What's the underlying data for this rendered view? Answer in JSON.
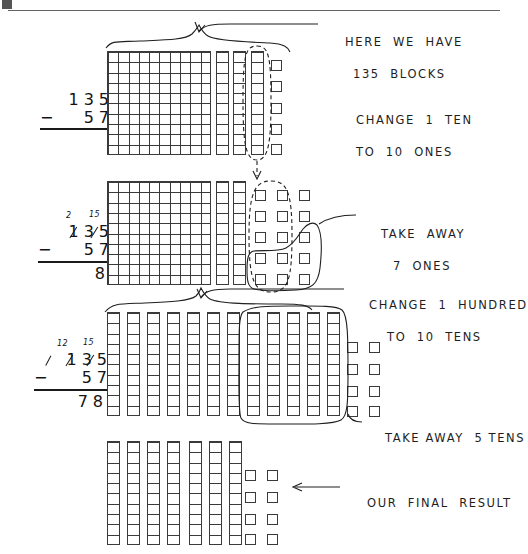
{
  "worksheet": {
    "title": "Subtraction with regrouping using base-ten blocks",
    "problem": {
      "minuend": "135",
      "subtrahend": "57",
      "difference": "78"
    },
    "ink_color": "#1f1f1f",
    "paper_color": "#ffffff"
  },
  "steps": [
    {
      "id": "step-1",
      "sum": {
        "minuend": "135",
        "minus_sign": "−",
        "subtrahend": "57",
        "answer": "",
        "regroup_marks": []
      },
      "annotations": [
        {
          "name": "here-we-have-135-blocks",
          "line1": "HERE  WE  HAVE",
          "line2": "135  BLOCKS"
        },
        {
          "name": "change-1-ten-to-10-ones",
          "line1": "CHANGE  1  TEN",
          "line2": "TO  10  ONES"
        }
      ],
      "blocks": {
        "hundreds": 1,
        "tens": 3,
        "ones": 5,
        "circled_tens": 1,
        "circled_ones": 0
      }
    },
    {
      "id": "step-2",
      "sum": {
        "minuend": "135",
        "minus_sign": "−",
        "subtrahend": "57",
        "answer": "8",
        "regroup_marks": [
          "2",
          "15"
        ]
      },
      "annotations": [
        {
          "name": "take-away-7-ones",
          "line1": "TAKE  AWAY",
          "line2": "7  ONES"
        },
        {
          "name": "change-1-hundred-to-10-tens",
          "line1": "CHANGE  1  HUNDRED",
          "line2": "TO  10  TENS"
        }
      ],
      "blocks": {
        "hundreds": 1,
        "tens": 2,
        "ones": 15,
        "circled_ones": 7,
        "new_ones": 10
      }
    },
    {
      "id": "step-3",
      "sum": {
        "minuend": "135",
        "minus_sign": "−",
        "subtrahend": "57",
        "answer": "78",
        "regroup_marks": [
          "12",
          "15"
        ]
      },
      "annotations": [
        {
          "name": "take-away-5-tens",
          "line1": "TAKE AWAY  5 TENS",
          "line2": ""
        }
      ],
      "blocks": {
        "hundreds": 0,
        "tens": 12,
        "ones": 8,
        "circled_tens": 5
      }
    },
    {
      "id": "step-4",
      "sum": null,
      "annotations": [
        {
          "name": "our-final-result",
          "line1": "OUR  FINAL  RESULT",
          "line2": ""
        }
      ],
      "blocks": {
        "hundreds": 0,
        "tens": 7,
        "ones": 8
      }
    }
  ]
}
